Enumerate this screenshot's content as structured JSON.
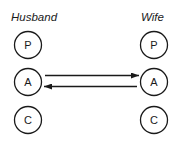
{
  "diagram": {
    "type": "transactional-analysis",
    "columns": [
      {
        "label": "Husband",
        "states": [
          "P",
          "A",
          "C"
        ]
      },
      {
        "label": "Wife",
        "states": [
          "P",
          "A",
          "C"
        ]
      }
    ],
    "transactions": [
      {
        "from": "Husband.A",
        "to": "Wife.A",
        "direction": "right"
      },
      {
        "from": "Wife.A",
        "to": "Husband.A",
        "direction": "left"
      }
    ],
    "colors": {
      "ink": "#1a1a1a",
      "background": "#ffffff"
    }
  }
}
